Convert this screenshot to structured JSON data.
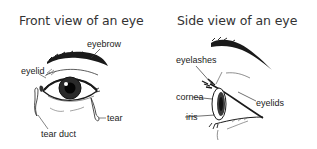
{
  "front_view": {
    "title": "Front view of an eye",
    "labels": {
      "eyebrow": "eyebrow",
      "eyelid": "eyelid",
      "tear": "tear",
      "tear_duct": "tear duct"
    }
  },
  "side_view": {
    "title": "Side view of an eye",
    "labels": {
      "eyelashes": "eyelashes",
      "cornea": "cornea",
      "iris": "iris",
      "eyelids": "eyelids"
    }
  },
  "colors": {
    "background": "#ffffff",
    "ink": "#1a1a1a",
    "text": "#222222"
  }
}
